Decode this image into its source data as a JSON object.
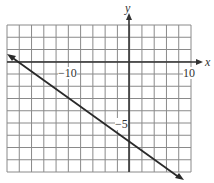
{
  "chart_data": {
    "type": "line",
    "title": "",
    "xlabel": "x",
    "ylabel": "y",
    "xlim": [
      -20,
      10
    ],
    "ylim": [
      -9,
      3
    ],
    "x_grid_step": 2,
    "y_grid_step": 1,
    "grid": true,
    "tick_labels": {
      "x": [
        "-10",
        "10"
      ],
      "y": [
        "-5"
      ]
    },
    "series": [
      {
        "name": "line",
        "x": [
          -20,
          0,
          8.6
        ],
        "y": [
          0.6,
          -6,
          -9.6
        ],
        "arrows": "both"
      }
    ]
  },
  "labels": {
    "y_axis": "y",
    "x_axis": "x",
    "x_neg10": "−10",
    "x_10": "10",
    "y_neg5": "−5"
  },
  "colors": {
    "grid": "#8a8a8a",
    "axis": "#333333",
    "line": "#2a2a2a"
  }
}
